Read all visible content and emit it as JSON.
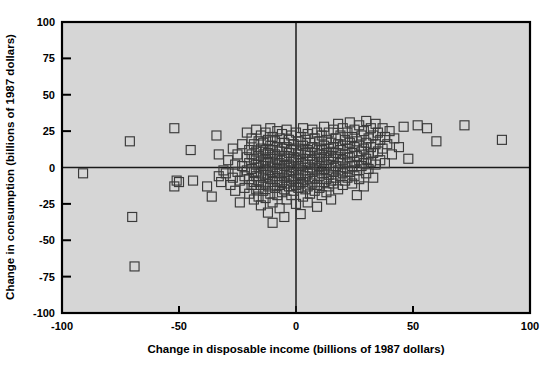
{
  "figure": {
    "background_color": "#ffffff",
    "plot_background_color": "#d6d6d6",
    "marker_color": "#3a3a3a",
    "axis_color": "#000000"
  },
  "chart_data": {
    "type": "scatter",
    "title": "",
    "xlabel": "Change in disposable income (billions of 1987 dollars)",
    "ylabel": "Change in consumption (billions of 1987 dollars)",
    "xlim": [
      -100,
      100
    ],
    "ylim": [
      -100,
      100
    ],
    "xticks": [
      -100,
      -50,
      0,
      50,
      100
    ],
    "yticks": [
      -100,
      -75,
      -50,
      -25,
      0,
      25,
      50,
      75,
      100
    ],
    "xticklabels": [
      "-100",
      "-50",
      "0",
      "50",
      "100"
    ],
    "yticklabels": [
      "-100",
      "-75",
      "-50",
      "-25",
      "0",
      "25",
      "50",
      "75",
      "100"
    ],
    "grid": false,
    "legend": null,
    "marker": "open-square",
    "marker_size": 9,
    "reference_lines": [
      {
        "axis": "horizontal",
        "value": 0
      },
      {
        "axis": "vertical",
        "value": 0
      }
    ],
    "n_points": 172,
    "points": [
      [
        -91,
        -4
      ],
      [
        -71,
        18
      ],
      [
        -70,
        -34
      ],
      [
        -69,
        -68
      ],
      [
        -52,
        27
      ],
      [
        -52,
        -13
      ],
      [
        -51,
        -9
      ],
      [
        -50,
        -10
      ],
      [
        -45,
        12
      ],
      [
        -44,
        -9
      ],
      [
        -38,
        -13
      ],
      [
        -36,
        -20
      ],
      [
        -34,
        22
      ],
      [
        -33,
        9
      ],
      [
        -33,
        -6
      ],
      [
        -32,
        -10
      ],
      [
        -31,
        -2
      ],
      [
        -30,
        -4
      ],
      [
        -29,
        5
      ],
      [
        -28,
        -12
      ],
      [
        -27,
        13
      ],
      [
        -27,
        -7
      ],
      [
        -26,
        2
      ],
      [
        -26,
        -16
      ],
      [
        -25,
        9
      ],
      [
        -25,
        -3
      ],
      [
        -24,
        -9
      ],
      [
        -24,
        -24
      ],
      [
        -23,
        16
      ],
      [
        -23,
        1
      ],
      [
        -22,
        -6
      ],
      [
        -22,
        -14
      ],
      [
        -21,
        24
      ],
      [
        -21,
        7
      ],
      [
        -21,
        -2
      ],
      [
        -20,
        12
      ],
      [
        -20,
        3
      ],
      [
        -20,
        -8
      ],
      [
        -20,
        -18
      ],
      [
        -19,
        20
      ],
      [
        -19,
        9
      ],
      [
        -19,
        -1
      ],
      [
        -19,
        -12
      ],
      [
        -18,
        16
      ],
      [
        -18,
        6
      ],
      [
        -18,
        -3
      ],
      [
        -18,
        -10
      ],
      [
        -18,
        -22
      ],
      [
        -17,
        26
      ],
      [
        -17,
        11
      ],
      [
        -17,
        2
      ],
      [
        -17,
        -6
      ],
      [
        -17,
        -15
      ],
      [
        -16,
        18
      ],
      [
        -16,
        8
      ],
      [
        -16,
        0
      ],
      [
        -16,
        -9
      ],
      [
        -16,
        -20
      ],
      [
        -15,
        22
      ],
      [
        -15,
        13
      ],
      [
        -15,
        4
      ],
      [
        -15,
        -4
      ],
      [
        -15,
        -12
      ],
      [
        -15,
        -26
      ],
      [
        -14,
        17
      ],
      [
        -14,
        9
      ],
      [
        -14,
        1
      ],
      [
        -14,
        -7
      ],
      [
        -14,
        -16
      ],
      [
        -13,
        24
      ],
      [
        -13,
        12
      ],
      [
        -13,
        5
      ],
      [
        -13,
        -2
      ],
      [
        -13,
        -11
      ],
      [
        -13,
        -21
      ],
      [
        -12,
        19
      ],
      [
        -12,
        10
      ],
      [
        -12,
        3
      ],
      [
        -12,
        -5
      ],
      [
        -12,
        -13
      ],
      [
        -12,
        -31
      ],
      [
        -11,
        27
      ],
      [
        -11,
        15
      ],
      [
        -11,
        7
      ],
      [
        -11,
        0
      ],
      [
        -11,
        -8
      ],
      [
        -11,
        -18
      ],
      [
        -10,
        21
      ],
      [
        -10,
        12
      ],
      [
        -10,
        4
      ],
      [
        -10,
        -3
      ],
      [
        -10,
        -10
      ],
      [
        -10,
        -24
      ],
      [
        -10,
        -38
      ],
      [
        -9,
        18
      ],
      [
        -9,
        9
      ],
      [
        -9,
        2
      ],
      [
        -9,
        -6
      ],
      [
        -9,
        -14
      ],
      [
        -8,
        25
      ],
      [
        -8,
        14
      ],
      [
        -8,
        6
      ],
      [
        -8,
        -1
      ],
      [
        -8,
        -9
      ],
      [
        -8,
        -19
      ],
      [
        -7,
        20
      ],
      [
        -7,
        11
      ],
      [
        -7,
        3
      ],
      [
        -7,
        -4
      ],
      [
        -7,
        -12
      ],
      [
        -7,
        -28
      ],
      [
        -6,
        23
      ],
      [
        -6,
        13
      ],
      [
        -6,
        5
      ],
      [
        -6,
        -2
      ],
      [
        -6,
        -10
      ],
      [
        -6,
        -17
      ],
      [
        -5,
        17
      ],
      [
        -5,
        8
      ],
      [
        -5,
        1
      ],
      [
        -5,
        -7
      ],
      [
        -5,
        -15
      ],
      [
        -5,
        -34
      ],
      [
        -4,
        26
      ],
      [
        -4,
        14
      ],
      [
        -4,
        6
      ],
      [
        -4,
        -3
      ],
      [
        -4,
        -11
      ],
      [
        -4,
        -22
      ],
      [
        -3,
        19
      ],
      [
        -3,
        10
      ],
      [
        -3,
        2
      ],
      [
        -3,
        -6
      ],
      [
        -3,
        -13
      ],
      [
        -2,
        22
      ],
      [
        -2,
        12
      ],
      [
        -2,
        4
      ],
      [
        -2,
        -2
      ],
      [
        -2,
        -9
      ],
      [
        -2,
        -19
      ],
      [
        -1,
        16
      ],
      [
        -1,
        7
      ],
      [
        -1,
        0
      ],
      [
        -1,
        -8
      ],
      [
        -1,
        -16
      ],
      [
        0,
        24
      ],
      [
        0,
        13
      ],
      [
        0,
        5
      ],
      [
        0,
        -4
      ],
      [
        0,
        -12
      ],
      [
        0,
        -25
      ],
      [
        1,
        18
      ],
      [
        1,
        9
      ],
      [
        1,
        1
      ],
      [
        1,
        -7
      ],
      [
        1,
        -14
      ],
      [
        2,
        21
      ],
      [
        2,
        11
      ],
      [
        2,
        3
      ],
      [
        2,
        -5
      ],
      [
        2,
        -11
      ],
      [
        2,
        -32
      ],
      [
        3,
        27
      ],
      [
        3,
        15
      ],
      [
        3,
        6
      ],
      [
        3,
        -2
      ],
      [
        3,
        -10
      ],
      [
        3,
        -20
      ],
      [
        4,
        19
      ],
      [
        4,
        10
      ],
      [
        4,
        2
      ],
      [
        4,
        -6
      ],
      [
        4,
        -15
      ],
      [
        5,
        23
      ],
      [
        5,
        12
      ],
      [
        5,
        4
      ],
      [
        5,
        -4
      ],
      [
        5,
        -13
      ],
      [
        5,
        -24
      ],
      [
        6,
        17
      ],
      [
        6,
        8
      ],
      [
        6,
        0
      ],
      [
        6,
        -8
      ],
      [
        6,
        -18
      ],
      [
        7,
        26
      ],
      [
        7,
        14
      ],
      [
        7,
        5
      ],
      [
        7,
        -3
      ],
      [
        7,
        -11
      ],
      [
        8,
        20
      ],
      [
        8,
        10
      ],
      [
        8,
        2
      ],
      [
        8,
        -7
      ],
      [
        8,
        -16
      ],
      [
        9,
        24
      ],
      [
        9,
        13
      ],
      [
        9,
        6
      ],
      [
        9,
        -2
      ],
      [
        9,
        -12
      ],
      [
        9,
        -27
      ],
      [
        10,
        18
      ],
      [
        10,
        9
      ],
      [
        10,
        1
      ],
      [
        10,
        -6
      ],
      [
        10,
        -14
      ],
      [
        11,
        22
      ],
      [
        11,
        12
      ],
      [
        11,
        4
      ],
      [
        11,
        -4
      ],
      [
        11,
        -19
      ],
      [
        12,
        28
      ],
      [
        12,
        15
      ],
      [
        12,
        7
      ],
      [
        12,
        -1
      ],
      [
        12,
        -10
      ],
      [
        13,
        19
      ],
      [
        13,
        10
      ],
      [
        13,
        2
      ],
      [
        13,
        -8
      ],
      [
        13,
        -17
      ],
      [
        14,
        24
      ],
      [
        14,
        13
      ],
      [
        14,
        5
      ],
      [
        14,
        -5
      ],
      [
        14,
        -13
      ],
      [
        15,
        17
      ],
      [
        15,
        8
      ],
      [
        15,
        0
      ],
      [
        15,
        -9
      ],
      [
        15,
        -22
      ],
      [
        16,
        26
      ],
      [
        16,
        14
      ],
      [
        16,
        6
      ],
      [
        16,
        -3
      ],
      [
        16,
        -11
      ],
      [
        17,
        20
      ],
      [
        17,
        10
      ],
      [
        17,
        1
      ],
      [
        17,
        -7
      ],
      [
        18,
        30
      ],
      [
        18,
        16
      ],
      [
        18,
        7
      ],
      [
        18,
        -2
      ],
      [
        18,
        -15
      ],
      [
        19,
        22
      ],
      [
        19,
        12
      ],
      [
        19,
        3
      ],
      [
        19,
        -6
      ],
      [
        20,
        27
      ],
      [
        20,
        15
      ],
      [
        20,
        5
      ],
      [
        20,
        -4
      ],
      [
        20,
        -12
      ],
      [
        21,
        19
      ],
      [
        21,
        9
      ],
      [
        21,
        0
      ],
      [
        21,
        -9
      ],
      [
        22,
        24
      ],
      [
        22,
        13
      ],
      [
        22,
        4
      ],
      [
        22,
        -7
      ],
      [
        23,
        31
      ],
      [
        23,
        17
      ],
      [
        23,
        7
      ],
      [
        23,
        -3
      ],
      [
        24,
        21
      ],
      [
        24,
        10
      ],
      [
        24,
        1
      ],
      [
        24,
        -11
      ],
      [
        25,
        26
      ],
      [
        25,
        14
      ],
      [
        25,
        4
      ],
      [
        25,
        -6
      ],
      [
        26,
        18
      ],
      [
        26,
        8
      ],
      [
        26,
        -2
      ],
      [
        26,
        -19
      ],
      [
        27,
        29
      ],
      [
        27,
        15
      ],
      [
        27,
        5
      ],
      [
        27,
        -8
      ],
      [
        28,
        22
      ],
      [
        28,
        11
      ],
      [
        28,
        1
      ],
      [
        29,
        25
      ],
      [
        29,
        13
      ],
      [
        29,
        3
      ],
      [
        29,
        -13
      ],
      [
        30,
        32
      ],
      [
        30,
        17
      ],
      [
        30,
        6
      ],
      [
        30,
        -4
      ],
      [
        31,
        20
      ],
      [
        31,
        9
      ],
      [
        31,
        -1
      ],
      [
        32,
        27
      ],
      [
        32,
        14
      ],
      [
        32,
        4
      ],
      [
        33,
        22
      ],
      [
        33,
        10
      ],
      [
        33,
        -7
      ],
      [
        34,
        30
      ],
      [
        34,
        16
      ],
      [
        34,
        2
      ],
      [
        35,
        24
      ],
      [
        35,
        11
      ],
      [
        36,
        19
      ],
      [
        36,
        5
      ],
      [
        37,
        27
      ],
      [
        37,
        13
      ],
      [
        38,
        21
      ],
      [
        38,
        3
      ],
      [
        39,
        16
      ],
      [
        40,
        25
      ],
      [
        41,
        9
      ],
      [
        42,
        20
      ],
      [
        44,
        14
      ],
      [
        46,
        28
      ],
      [
        48,
        6
      ],
      [
        52,
        29
      ],
      [
        56,
        27
      ],
      [
        60,
        18
      ],
      [
        72,
        29
      ],
      [
        88,
        19
      ]
    ]
  }
}
